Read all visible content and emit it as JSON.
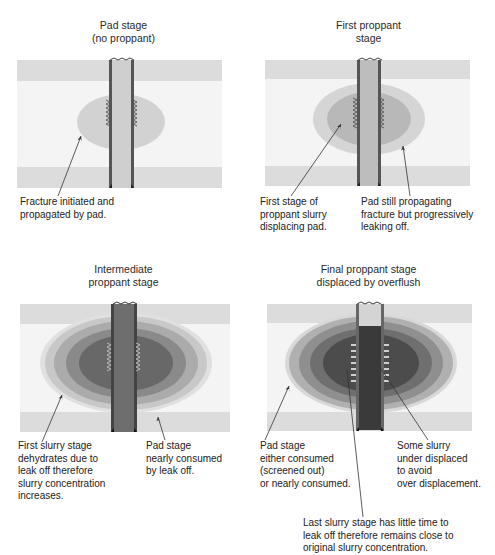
{
  "panels": [
    {
      "id": "pad",
      "title": "Pad stage\n(no proppant)",
      "labels": [
        "Fracture initiated and\npropagated by pad."
      ]
    },
    {
      "id": "first",
      "title": "First proppant\nstage",
      "labels": [
        "First stage of\nproppant slurry\ndisplacing pad.",
        "Pad still propagating\nfracture but progressively\nleaking off."
      ]
    },
    {
      "id": "intermediate",
      "title": "Intermediate\nproppant stage",
      "labels": [
        "First slurry stage\ndehydrates due to\nleak off therefore\nslurry concentration\nincreases.",
        "Pad stage\nnearly consumed\nby leak off."
      ]
    },
    {
      "id": "final",
      "title": "Final proppant stage\ndisplaced by overflush",
      "labels": [
        "Pad stage\neither consumed\n(screened out)\nor nearly consumed.",
        "Some slurry\nunder displaced\nto avoid\nover displacement.",
        "Last slurry stage has little time to\nleak off therefore remains close to\noriginal slurry concentration."
      ]
    }
  ],
  "colors": {
    "formation_band": "#dcdcdc",
    "formation_bg": "#f3f3f3",
    "pad": "#d4d4d4",
    "slurry1": "#b5b5b5",
    "slurry2": "#999999",
    "slurry3": "#7c7c7c",
    "slurry4": "#5c5c5c",
    "wellbore": "#c8c8c8",
    "casing": "#555555"
  }
}
